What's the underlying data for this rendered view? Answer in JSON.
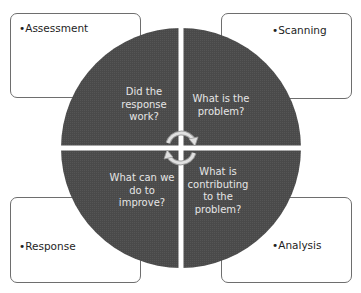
{
  "diagram": {
    "colors": {
      "circle_fill": "#4a4a4a",
      "divider": "#ffffff",
      "box_border": "#6e6e6e",
      "question_text": "#e6e6e6",
      "arrow": "#c8c8c8"
    },
    "stages": [
      {
        "id": "assessment",
        "label": "•Assessment",
        "question": "Did the response work?",
        "question_lines": [
          "Did the",
          "response",
          "work?"
        ],
        "position": "top-left"
      },
      {
        "id": "scanning",
        "label": "•Scanning",
        "question": "What is the problem?",
        "question_lines": [
          "What is the",
          "problem?"
        ],
        "position": "top-right"
      },
      {
        "id": "analysis",
        "label": "•Analysis",
        "question": "What is contributing to the problem?",
        "question_lines": [
          "What is",
          "contributing",
          "to the",
          "problem?"
        ],
        "position": "bottom-right"
      },
      {
        "id": "response",
        "label": "•Response",
        "question": "What can we do to improve?",
        "question_lines": [
          "What can we",
          "do to",
          "improve?"
        ],
        "position": "bottom-left"
      }
    ],
    "center_icon": "circular-arrows-icon"
  }
}
